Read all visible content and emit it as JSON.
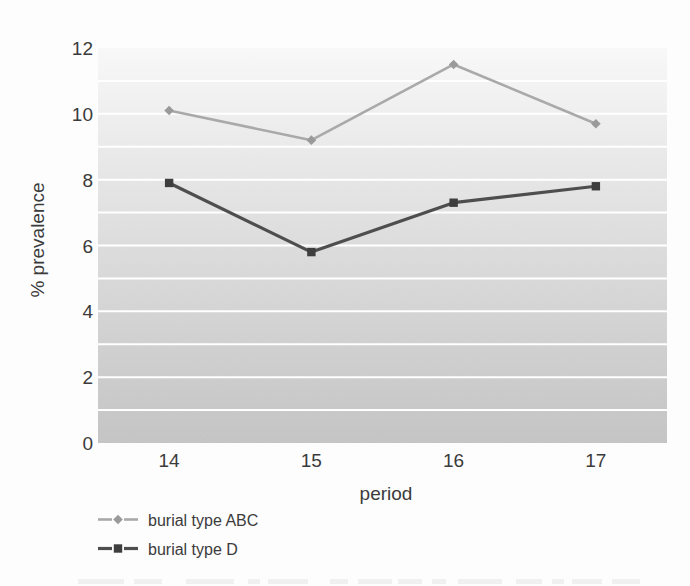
{
  "figure": {
    "background_color": "#fdfdfd",
    "text_color": "#3b3b3b",
    "bottom_caption_cropped": true
  },
  "chart_data": {
    "type": "line",
    "title": "",
    "xlabel": "period",
    "ylabel": "% prevalence",
    "categories": [
      "14",
      "15",
      "16",
      "17"
    ],
    "series": [
      {
        "name": "burial type ABC",
        "values": [
          10.1,
          9.2,
          11.5,
          9.7
        ],
        "color": "#a9a9a9",
        "marker": "diamond",
        "marker_color": "#9a9a9a",
        "line_width": 2.6
      },
      {
        "name": "burial type D",
        "values": [
          7.9,
          5.8,
          7.3,
          7.8
        ],
        "color": "#4e4e4e",
        "marker": "square",
        "marker_color": "#3e3e3e",
        "line_width": 3.2
      }
    ],
    "ylim": [
      0,
      12
    ],
    "y_tick_step": 2,
    "y_tick_labels": [
      "0",
      "2",
      "4",
      "6",
      "8",
      "10",
      "12"
    ],
    "gridline_step": 1,
    "grid_on": true,
    "grid_color": "#ffffff",
    "plot_bg_gradient_top": "#f8f8f8",
    "plot_bg_gradient_mid": "#dcdcdc",
    "plot_bg_gradient_bottom": "#c4c4c4",
    "legend_position": "bottom-left"
  }
}
